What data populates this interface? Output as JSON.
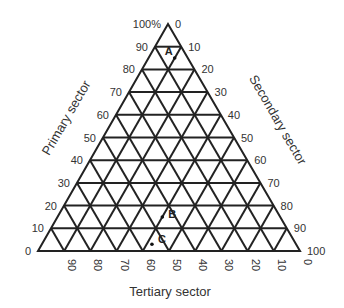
{
  "chart_data": {
    "type": "ternary",
    "title": "",
    "axes": {
      "primary": {
        "label": "Primary sector",
        "ticks": [
          "0",
          "10",
          "20",
          "30",
          "40",
          "50",
          "60",
          "70",
          "80",
          "90",
          "100%"
        ],
        "side": "left"
      },
      "secondary": {
        "label": "Secondary sector",
        "ticks": [
          "0",
          "10",
          "20",
          "30",
          "40",
          "50",
          "60",
          "70",
          "80",
          "90",
          "100"
        ],
        "side": "right"
      },
      "tertiary": {
        "label": "Tertiary sector",
        "ticks": [
          "90",
          "80",
          "70",
          "60",
          "50",
          "40",
          "30",
          "20",
          "10",
          "0"
        ],
        "side": "bottom"
      }
    },
    "grid": true,
    "grid_step": 10,
    "points": [
      {
        "label": "A",
        "primary": 85,
        "secondary": 10,
        "tertiary": 5
      },
      {
        "label": "B",
        "primary": 15,
        "secondary": 40,
        "tertiary": 45
      },
      {
        "label": "C",
        "primary": 3,
        "secondary": 42,
        "tertiary": 55
      }
    ]
  },
  "colors": {
    "line": "#222222",
    "text": "#333333",
    "background": "#ffffff"
  }
}
